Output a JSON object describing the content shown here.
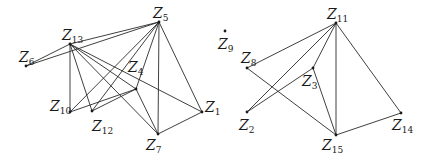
{
  "figure": {
    "edge_color": "#2a2a2a",
    "node_color": "#1a1a1a"
  },
  "nodes": [
    {
      "id": "Z1",
      "letter": "Z",
      "sub": "1",
      "x": 202,
      "y": 112,
      "lx": 205,
      "ly": 112
    },
    {
      "id": "Z2",
      "letter": "Z",
      "sub": "2",
      "x": 247,
      "y": 112,
      "lx": 239,
      "ly": 130
    },
    {
      "id": "Z3",
      "letter": "Z",
      "sub": "3",
      "x": 313,
      "y": 68,
      "lx": 302,
      "ly": 86
    },
    {
      "id": "Z4",
      "letter": "Z",
      "sub": "4",
      "x": 136,
      "y": 89,
      "lx": 128,
      "ly": 72
    },
    {
      "id": "Z5",
      "letter": "Z",
      "sub": "5",
      "x": 159,
      "y": 22,
      "lx": 153,
      "ly": 18
    },
    {
      "id": "Z6",
      "letter": "Z",
      "sub": "6",
      "x": 26,
      "y": 66,
      "lx": 19,
      "ly": 62
    },
    {
      "id": "Z7",
      "letter": "Z",
      "sub": "7",
      "x": 158,
      "y": 134,
      "lx": 146,
      "ly": 150
    },
    {
      "id": "Z8",
      "letter": "Z",
      "sub": "8",
      "x": 247,
      "y": 68,
      "lx": 241,
      "ly": 63
    },
    {
      "id": "Z9",
      "letter": "Z",
      "sub": "9",
      "x": 225,
      "y": 31,
      "lx": 218,
      "ly": 49
    },
    {
      "id": "Z10",
      "letter": "Z",
      "sub": "10",
      "x": 70,
      "y": 112,
      "lx": 50,
      "ly": 111
    },
    {
      "id": "Z11",
      "letter": "Z",
      "sub": "11",
      "x": 336,
      "y": 23,
      "lx": 327,
      "ly": 19
    },
    {
      "id": "Z12",
      "letter": "Z",
      "sub": "12",
      "x": 92,
      "y": 111,
      "lx": 92,
      "ly": 131
    },
    {
      "id": "Z13",
      "letter": "Z",
      "sub": "13",
      "x": 70,
      "y": 44,
      "lx": 62,
      "ly": 40
    },
    {
      "id": "Z14",
      "letter": "Z",
      "sub": "14",
      "x": 401,
      "y": 113,
      "lx": 392,
      "ly": 130
    },
    {
      "id": "Z15",
      "letter": "Z",
      "sub": "15",
      "x": 336,
      "y": 135,
      "lx": 322,
      "ly": 150
    }
  ],
  "edges": [
    [
      "Z6",
      "Z13"
    ],
    [
      "Z6",
      "Z5"
    ],
    [
      "Z13",
      "Z5"
    ],
    [
      "Z13",
      "Z10"
    ],
    [
      "Z13",
      "Z12"
    ],
    [
      "Z13",
      "Z4"
    ],
    [
      "Z13",
      "Z7"
    ],
    [
      "Z13",
      "Z1"
    ],
    [
      "Z5",
      "Z10"
    ],
    [
      "Z5",
      "Z12"
    ],
    [
      "Z5",
      "Z4"
    ],
    [
      "Z5",
      "Z7"
    ],
    [
      "Z5",
      "Z1"
    ],
    [
      "Z10",
      "Z4"
    ],
    [
      "Z12",
      "Z4"
    ],
    [
      "Z4",
      "Z7"
    ],
    [
      "Z7",
      "Z1"
    ],
    [
      "Z8",
      "Z11"
    ],
    [
      "Z8",
      "Z15"
    ],
    [
      "Z2",
      "Z11"
    ],
    [
      "Z2",
      "Z3"
    ],
    [
      "Z11",
      "Z3"
    ],
    [
      "Z11",
      "Z15"
    ],
    [
      "Z11",
      "Z14"
    ],
    [
      "Z3",
      "Z15"
    ],
    [
      "Z15",
      "Z14"
    ]
  ]
}
